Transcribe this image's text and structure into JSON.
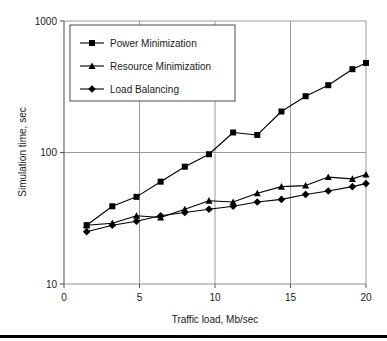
{
  "chart_data": {
    "type": "line",
    "title": "",
    "xlabel": "Traffic load, Mb/sec",
    "ylabel": "Simulation time, sec",
    "xlim": [
      0,
      20
    ],
    "ylim": [
      10,
      1000
    ],
    "yscale": "log",
    "xscale": "linear",
    "xticks": [
      "0",
      "5",
      "10",
      "15",
      "20"
    ],
    "xtick_values": [
      0,
      5,
      10,
      15,
      20
    ],
    "yticks": [
      "10",
      "100",
      "1000"
    ],
    "ytick_values": [
      10,
      100,
      1000
    ],
    "grid": "both",
    "legend_position": "upper-left-inside",
    "series": [
      {
        "name": "Power Minimization",
        "marker": "square",
        "color": "#000000",
        "x": [
          1.5,
          3.2,
          4.8,
          6.4,
          8.0,
          9.6,
          11.2,
          12.8,
          14.4,
          16.0,
          17.5,
          19.1,
          20.0
        ],
        "y": [
          28,
          39,
          46,
          60,
          78,
          97,
          142,
          136,
          205,
          268,
          325,
          430,
          480
        ]
      },
      {
        "name": "Resource Minimization",
        "marker": "triangle",
        "color": "#000000",
        "x": [
          1.5,
          3.2,
          4.8,
          6.4,
          8.0,
          9.6,
          11.2,
          12.8,
          14.4,
          16.0,
          17.5,
          19.1,
          20.0
        ],
        "y": [
          28,
          29,
          33,
          32,
          37,
          43,
          42,
          49,
          55,
          56,
          65,
          63,
          68
        ]
      },
      {
        "name": "Load Balancing",
        "marker": "diamond",
        "color": "#000000",
        "x": [
          1.5,
          3.2,
          4.8,
          6.4,
          8.0,
          9.6,
          11.2,
          12.8,
          14.4,
          16.0,
          17.5,
          19.1,
          20.0
        ],
        "y": [
          25,
          28,
          30,
          33,
          35,
          37,
          39,
          42,
          44,
          48,
          51,
          55,
          58
        ]
      }
    ],
    "legend": [
      "Power Minimization",
      "Resource Minimization",
      "Load Balancing"
    ]
  }
}
